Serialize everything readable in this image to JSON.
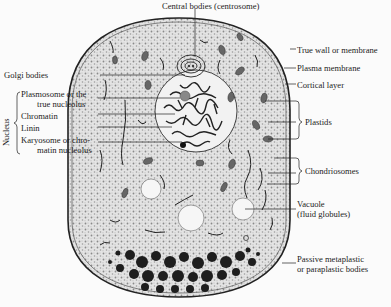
{
  "diagram": {
    "colors": {
      "background": "#fbfbfb",
      "cytoplasm": "#dcdcdc",
      "ink": "#1c1c1c",
      "vacuole": "#f6f6f6",
      "bodies": "#222222"
    },
    "labels": {
      "top": "Central bodies (centrosome)",
      "golgi": "Golgi bodies",
      "nucleus_group": "Nucleus",
      "plasmosome_1": "Plasmosome or the",
      "plasmosome_2": "true nucleolus",
      "chromatin": "Chromatin",
      "linin": "Linin",
      "karyosome_1": "Karyosome or chro-",
      "karyosome_2": "matin nucleolus",
      "true_wall": "True wall or membrane",
      "plasma_membrane": "Plasma membrane",
      "cortical": "Cortical layer",
      "plastids": "Plastids",
      "chondriosomes": "Chondriosomes",
      "vacuole_1": "Vacuole",
      "vacuole_2": "(fluid globules)",
      "passive_1": "Passive metaplastic",
      "passive_2": "or paraplastic bodies"
    }
  }
}
